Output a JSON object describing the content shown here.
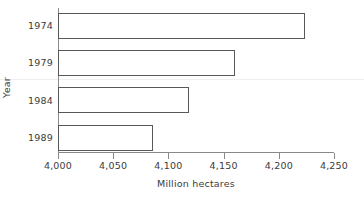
{
  "chart_data": {
    "type": "bar",
    "orientation": "horizontal",
    "title": "",
    "xlabel": "Million hectares",
    "ylabel": "Year",
    "categories": [
      "1974",
      "1979",
      "1984",
      "1989"
    ],
    "values": [
      4224,
      4160,
      4119,
      4086
    ],
    "xlim": [
      4000,
      4250
    ],
    "x_ticks": [
      4000,
      4050,
      4100,
      4150,
      4200,
      4250
    ],
    "x_tick_labels": [
      "4,000",
      "4,050",
      "4,100",
      "4,150",
      "4,200",
      "4,250"
    ],
    "grid": false,
    "legend": null,
    "series": [
      {
        "name": "Million hectares",
        "values": [
          4224,
          4160,
          4119,
          4086
        ]
      }
    ],
    "bar_style": {
      "fill": "#ffffff",
      "edge": "#585858"
    },
    "axis_color": "#8a8a8a",
    "text_color": "#3b3b3b",
    "background": "#ffffff"
  }
}
